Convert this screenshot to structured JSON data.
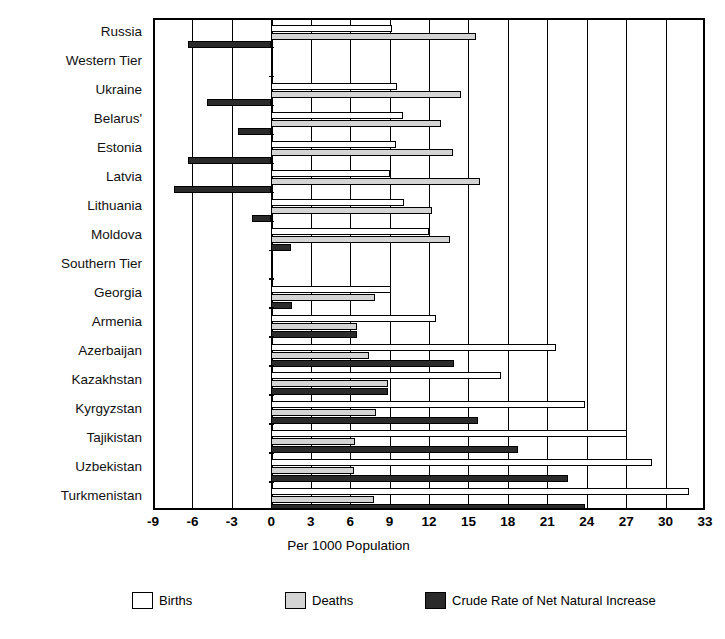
{
  "chart_data": {
    "type": "bar",
    "orientation": "horizontal",
    "title": "",
    "xlabel": "Per 1000 Population",
    "ylabel": "",
    "xlim": [
      -9,
      33
    ],
    "xticks": [
      -9,
      -6,
      -3,
      0,
      3,
      6,
      9,
      12,
      15,
      18,
      21,
      24,
      27,
      30,
      33
    ],
    "xtick_labels": [
      "-9",
      "-6",
      "-3",
      "0",
      "3",
      "6",
      "9",
      "12",
      "15",
      "18",
      "21",
      "24",
      "27",
      "30",
      "33"
    ],
    "grid": true,
    "legend_position": "bottom",
    "categories": [
      "Russia",
      "Western Tier",
      "Ukraine",
      "Belarus'",
      "Estonia",
      "Latvia",
      "Lithuania",
      "Moldova",
      "Southern Tier",
      "Georgia",
      "Armenia",
      "Azerbaijan",
      "Kazakhstan",
      "Kyrgyzstan",
      "Tajikistan",
      "Uzbekistan",
      "Turkmenistan"
    ],
    "group_headers": [
      "Western Tier",
      "Southern Tier"
    ],
    "series": [
      {
        "name": "Births",
        "color": "#ffffff",
        "values": [
          9.2,
          null,
          9.6,
          10.0,
          9.5,
          9.0,
          10.1,
          12.0,
          null,
          9.1,
          12.5,
          21.7,
          17.5,
          23.9,
          27.1,
          29.0,
          31.8
        ]
      },
      {
        "name": "Deaths",
        "color": "#d4d4d4",
        "values": [
          15.6,
          null,
          14.4,
          12.9,
          13.8,
          15.9,
          12.2,
          13.6,
          null,
          7.9,
          6.5,
          7.4,
          8.9,
          8.0,
          6.4,
          6.3,
          7.8
        ]
      },
      {
        "name": "Crude Rate of Net Natural Increase",
        "color": "#2a2a2a",
        "values": [
          -6.3,
          null,
          -4.9,
          -2.5,
          -6.3,
          -7.4,
          -1.5,
          1.5,
          null,
          1.6,
          6.5,
          13.9,
          8.9,
          15.7,
          18.8,
          22.6,
          23.9
        ]
      }
    ]
  },
  "axis": {
    "x_title": "Per 1000 Population"
  },
  "legend": {
    "items": [
      {
        "label": "Births",
        "swatch": "births"
      },
      {
        "label": "Deaths",
        "swatch": "deaths"
      },
      {
        "label": "Crude Rate of Net Natural Increase",
        "swatch": "natural"
      }
    ]
  }
}
